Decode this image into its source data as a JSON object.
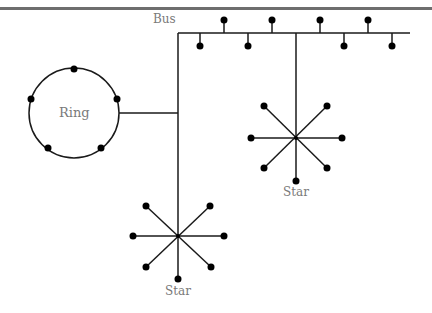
{
  "diagram": {
    "labels": {
      "bus": "Bus",
      "ring": "Ring",
      "star_right": "Star",
      "star_bottom": "Star"
    },
    "colors": {
      "line": "#1a1a1a",
      "node": "#000000",
      "label": "#7a7a7a",
      "rule": "#6e6e6e"
    },
    "bus": {
      "y": 33,
      "x_start": 178,
      "x_end": 410,
      "up_nodes_x": [
        224,
        272,
        320,
        368
      ],
      "down_nodes_x": [
        200,
        248,
        344,
        392
      ]
    },
    "ring": {
      "cx": 74,
      "cy": 113,
      "r": 45,
      "node_count": 5
    },
    "stars": [
      {
        "name": "star-right",
        "cx": 296,
        "cy": 138
      },
      {
        "name": "star-bottom",
        "cx": 178,
        "cy": 236
      }
    ]
  }
}
